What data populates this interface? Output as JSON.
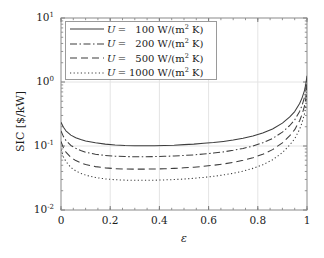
{
  "chart_data": {
    "type": "line",
    "title": "",
    "xlabel": "ε",
    "ylabel": "SIC [$/kW]",
    "yscale": "log",
    "xscale": "linear",
    "xlim": [
      0,
      1
    ],
    "ylim": [
      0.01,
      10
    ],
    "grid": true,
    "xticks": [
      0,
      0.2,
      0.4,
      0.6,
      0.8,
      1
    ],
    "xtick_labels": [
      "0",
      "0.2",
      "0.4",
      "0.6",
      "0.8",
      "1"
    ],
    "yticks": [
      0.01,
      0.1,
      1,
      10
    ],
    "ytick_labels": [
      "10⁻²",
      "10⁻¹",
      "10⁰",
      "10¹"
    ],
    "legend_position": "upper left",
    "x": [
      0.0,
      0.01,
      0.02,
      0.04,
      0.06,
      0.08,
      0.1,
      0.14,
      0.18,
      0.22,
      0.26,
      0.3,
      0.34,
      0.38,
      0.42,
      0.46,
      0.5,
      0.54,
      0.58,
      0.62,
      0.66,
      0.7,
      0.74,
      0.78,
      0.82,
      0.86,
      0.9,
      0.93,
      0.95,
      0.97,
      0.98,
      0.99,
      0.995,
      1.0
    ],
    "series": [
      {
        "name": "U = 100 W/(m² K)",
        "U": 100,
        "style": "solid",
        "values": [
          0.235,
          0.196,
          0.173,
          0.148,
          0.135,
          0.126,
          0.12,
          0.112,
          0.107,
          0.104,
          0.102,
          0.101,
          0.101,
          0.101,
          0.102,
          0.103,
          0.105,
          0.107,
          0.11,
          0.113,
          0.118,
          0.124,
          0.132,
          0.143,
          0.159,
          0.184,
          0.228,
          0.285,
          0.345,
          0.46,
          0.565,
          0.74,
          0.92,
          1.25
        ]
      },
      {
        "name": "U = 200 W/(m² K)",
        "U": 200,
        "style": "dashdot",
        "values": [
          0.172,
          0.14,
          0.122,
          0.102,
          0.092,
          0.085,
          0.08,
          0.0745,
          0.0712,
          0.0694,
          0.0684,
          0.068,
          0.068,
          0.0683,
          0.0689,
          0.0698,
          0.0711,
          0.0727,
          0.0748,
          0.0775,
          0.081,
          0.0855,
          0.0915,
          0.0998,
          0.112,
          0.131,
          0.165,
          0.209,
          0.256,
          0.347,
          0.432,
          0.578,
          0.73,
          1.1
        ]
      },
      {
        "name": "U = 500 W/(m² K)",
        "U": 500,
        "style": "dashed",
        "values": [
          0.118,
          0.0935,
          0.0805,
          0.0663,
          0.0592,
          0.0547,
          0.0515,
          0.0476,
          0.0455,
          0.0443,
          0.0437,
          0.0435,
          0.0435,
          0.0437,
          0.0441,
          0.0447,
          0.0456,
          0.0467,
          0.0481,
          0.05,
          0.0524,
          0.0555,
          0.0597,
          0.0655,
          0.0741,
          0.0877,
          0.112,
          0.145,
          0.18,
          0.248,
          0.313,
          0.425,
          0.545,
          0.88
        ]
      },
      {
        "name": "U = 1000 W/(m² K)",
        "U": 1000,
        "style": "dotted",
        "values": [
          0.088,
          0.0675,
          0.0572,
          0.0462,
          0.0408,
          0.0374,
          0.0351,
          0.0322,
          0.0306,
          0.0297,
          0.0293,
          0.0291,
          0.0291,
          0.0292,
          0.0295,
          0.0299,
          0.0305,
          0.0313,
          0.0323,
          0.0336,
          0.0353,
          0.0375,
          0.0405,
          0.0447,
          0.0509,
          0.0608,
          0.0788,
          0.104,
          0.13,
          0.182,
          0.232,
          0.319,
          0.414,
          0.7
        ]
      }
    ]
  },
  "legend": {
    "items": [
      {
        "symbol": "U",
        "equals": "=",
        "value": "100",
        "unit_prefix": "W/(m",
        "unit_sup": "2",
        "unit_suffix": " K)",
        "style": "solid"
      },
      {
        "symbol": "U",
        "equals": "=",
        "value": "200",
        "unit_prefix": "W/(m",
        "unit_sup": "2",
        "unit_suffix": " K)",
        "style": "dashdot"
      },
      {
        "symbol": "U",
        "equals": "=",
        "value": "500",
        "unit_prefix": "W/(m",
        "unit_sup": "2",
        "unit_suffix": " K)",
        "style": "dashed"
      },
      {
        "symbol": "U",
        "equals": "=",
        "value": "1000",
        "unit_prefix": "W/(m",
        "unit_sup": "2",
        "unit_suffix": " K)",
        "style": "dotted"
      }
    ]
  },
  "axes": {
    "x_title": "ε",
    "y_title": "SIC [$/kW]",
    "x_tick_labels": [
      "0",
      "0.2",
      "0.4",
      "0.6",
      "0.8",
      "1"
    ],
    "y_tick_mantissa": "10",
    "y_tick_exponents": [
      "1",
      "0",
      "-1",
      "-2"
    ]
  },
  "colors": {
    "line": "#3d3d3d",
    "axis": "#7a7a7a",
    "grid": "#e4e4e4",
    "background": "#ffffff",
    "text": "#1c1c1c"
  }
}
